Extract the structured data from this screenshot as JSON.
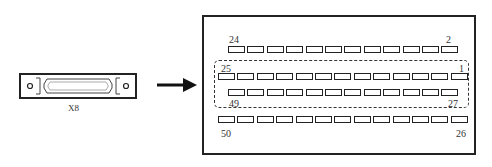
{
  "connector": {
    "label": "X8"
  },
  "arrow": {
    "direction": "right"
  },
  "pinout": {
    "row1": {
      "left_label": "24",
      "right_label": "2",
      "count": 12
    },
    "row2": {
      "left_label": "25",
      "right_label": "1",
      "count": 13
    },
    "row3": {
      "left_label": "49",
      "right_label": "27",
      "count": 12
    },
    "row4": {
      "left_label": "50",
      "right_label": "26",
      "count": 13
    }
  }
}
